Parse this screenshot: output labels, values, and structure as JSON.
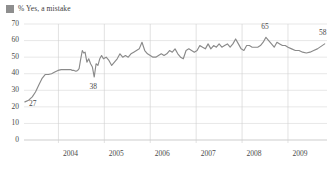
{
  "legend": {
    "swatch_color": "#8e8e8e",
    "label": "% Yes, a mistake"
  },
  "chart_data": {
    "type": "line",
    "title": "",
    "xlabel": "",
    "ylabel": "",
    "ylim": [
      0,
      70
    ],
    "xlim": [
      2003.25,
      2009.85
    ],
    "grid": true,
    "legend_position": "top-left",
    "line_color": "#8a8a8a",
    "ytick_labels": [
      "0",
      "10",
      "20",
      "30",
      "40",
      "50",
      "60",
      "70"
    ],
    "yticks": [
      0,
      10,
      20,
      30,
      40,
      50,
      60,
      70
    ],
    "xtick_labels": [
      "2004",
      "2005",
      "2006",
      "2007",
      "2008",
      "2009"
    ],
    "xticks": [
      2004,
      2005,
      2006,
      2007,
      2008,
      2009
    ],
    "series": [
      {
        "name": "% Yes, a mistake",
        "x": [
          2003.27,
          2003.35,
          2003.43,
          2003.5,
          2003.57,
          2003.64,
          2003.71,
          2003.78,
          2003.85,
          2003.92,
          2003.99,
          2004.06,
          2004.13,
          2004.2,
          2004.27,
          2004.3,
          2004.34,
          2004.38,
          2004.42,
          2004.45,
          2004.48,
          2004.52,
          2004.55,
          2004.58,
          2004.62,
          2004.66,
          2004.7,
          2004.74,
          2004.78,
          2004.82,
          2004.86,
          2004.9,
          2004.94,
          2004.98,
          2005.04,
          2005.1,
          2005.16,
          2005.22,
          2005.28,
          2005.34,
          2005.4,
          2005.46,
          2005.52,
          2005.58,
          2005.64,
          2005.7,
          2005.76,
          2005.82,
          2005.88,
          2005.94,
          2006.0,
          2006.06,
          2006.12,
          2006.18,
          2006.24,
          2006.3,
          2006.36,
          2006.42,
          2006.48,
          2006.54,
          2006.6,
          2006.66,
          2006.72,
          2006.78,
          2006.84,
          2006.9,
          2006.96,
          2007.02,
          2007.08,
          2007.14,
          2007.2,
          2007.26,
          2007.32,
          2007.38,
          2007.44,
          2007.5,
          2007.56,
          2007.62,
          2007.68,
          2007.74,
          2007.8,
          2007.86,
          2007.92,
          2007.98,
          2008.04,
          2008.1,
          2008.16,
          2008.22,
          2008.28,
          2008.34,
          2008.4,
          2008.46,
          2008.52,
          2008.58,
          2008.64,
          2008.7,
          2008.76,
          2008.82,
          2008.88,
          2008.94,
          2009.0,
          2009.08,
          2009.16,
          2009.24,
          2009.32,
          2009.4,
          2009.48,
          2009.56,
          2009.64,
          2009.72,
          2009.8
        ],
        "values": [
          23,
          24,
          26,
          29,
          33,
          37,
          39.5,
          39.5,
          40,
          41,
          42,
          42.5,
          42.5,
          42.5,
          42.5,
          42,
          42,
          41.5,
          42,
          43,
          48,
          54,
          52.5,
          53,
          47,
          49,
          46,
          44,
          38,
          46,
          45,
          49,
          51,
          49,
          50,
          48,
          45,
          47,
          49,
          52,
          50,
          51,
          50,
          52,
          53,
          54,
          55,
          59,
          54,
          52,
          51,
          50,
          50,
          51,
          52,
          51,
          52,
          54,
          53,
          55,
          52,
          50,
          49,
          54,
          55,
          54,
          53,
          54,
          57,
          56,
          55,
          58,
          55,
          57,
          56,
          58,
          56,
          57,
          58,
          56,
          58,
          61,
          58,
          55,
          54,
          57,
          57,
          56,
          56,
          56,
          57,
          59,
          62,
          60,
          58,
          56,
          59,
          58,
          57,
          57,
          56,
          55,
          54,
          54,
          53,
          52.5,
          53,
          54,
          55,
          56.5,
          58
        ]
      }
    ],
    "annotations": [
      {
        "text": "27",
        "x": 2003.44,
        "y": 20.5
      },
      {
        "text": "38",
        "x": 2004.76,
        "y": 30.5
      },
      {
        "text": "65",
        "x": 2008.5,
        "y": 67.0
      },
      {
        "text": "58",
        "x": 2009.76,
        "y": 63.5
      }
    ]
  }
}
